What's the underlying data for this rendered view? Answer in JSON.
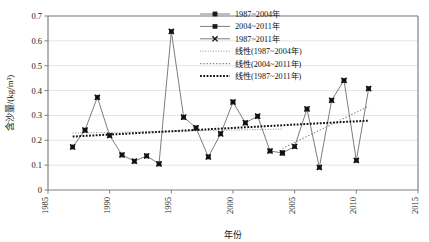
{
  "chart_data": {
    "type": "line",
    "title": "",
    "xlabel": "年份",
    "ylabel": "含沙量/(kg/m³)",
    "xlim": [
      1985,
      2015
    ],
    "ylim": [
      0,
      0.7
    ],
    "xticks": [
      "1985",
      "1990",
      "1995",
      "2000",
      "2005",
      "2010",
      "2015"
    ],
    "yticks": [
      "0",
      "0.1",
      "0.2",
      "0.3",
      "0.4",
      "0.5",
      "0.6",
      "0.7"
    ],
    "grid": true,
    "legend_position": "top-center",
    "x": [
      1987,
      1988,
      1989,
      1990,
      1991,
      1992,
      1993,
      1994,
      1995,
      1996,
      1997,
      1998,
      1999,
      2000,
      2001,
      2002,
      2003,
      2004,
      2005,
      2006,
      2007,
      2008,
      2009,
      2010,
      2011
    ],
    "series": [
      {
        "name": "1987~2004年",
        "marker": "square",
        "color": "#4a4a4a",
        "x": [
          1987,
          1988,
          1989,
          1990,
          1991,
          1992,
          1993,
          1994,
          1995,
          1996,
          1997,
          1998,
          1999,
          2000,
          2001,
          2002,
          2003,
          2004
        ],
        "values": [
          0.173,
          0.241,
          0.373,
          0.219,
          0.141,
          0.116,
          0.137,
          0.105,
          0.638,
          0.293,
          0.25,
          0.133,
          0.226,
          0.354,
          0.27,
          0.297,
          0.157,
          0.149
        ]
      },
      {
        "name": "2004~2011年",
        "marker": "square",
        "color": "#4a4a4a",
        "x": [
          2004,
          2005,
          2006,
          2007,
          2008,
          2009,
          2010,
          2011
        ],
        "values": [
          0.149,
          0.175,
          0.326,
          0.091,
          0.361,
          0.441,
          0.119,
          0.408
        ]
      },
      {
        "name": "1987~2011年",
        "marker": "cross",
        "color": "#111111",
        "x": [
          1987,
          1988,
          1989,
          1990,
          1991,
          1992,
          1993,
          1994,
          1995,
          1996,
          1997,
          1998,
          1999,
          2000,
          2001,
          2002,
          2003,
          2004,
          2005,
          2006,
          2007,
          2008,
          2009,
          2010,
          2011
        ],
        "values": [
          0.173,
          0.241,
          0.373,
          0.219,
          0.141,
          0.116,
          0.137,
          0.105,
          0.638,
          0.293,
          0.25,
          0.133,
          0.226,
          0.354,
          0.27,
          0.297,
          0.157,
          0.149,
          0.175,
          0.326,
          0.091,
          0.361,
          0.441,
          0.119,
          0.408
        ]
      }
    ],
    "trendlines": [
      {
        "name": "线性(1987~2004年)",
        "style": "dotted-fine",
        "color": "#7d7d7d",
        "x_start": 1987,
        "x_end": 2004,
        "y_start": 0.229,
        "y_end": 0.245
      },
      {
        "name": "线性(2004~2011年)",
        "style": "dotted-medium",
        "color": "#8a8a8a",
        "x_start": 2004,
        "x_end": 2011,
        "y_start": 0.167,
        "y_end": 0.337
      },
      {
        "name": "线性(1987~2011年)",
        "style": "dotted-bold",
        "color": "#111111",
        "x_start": 1987,
        "x_end": 2011,
        "y_start": 0.215,
        "y_end": 0.279
      }
    ]
  },
  "legend": {
    "items": [
      {
        "label": "1987~2004年",
        "kind": "marker-line",
        "marker": "square"
      },
      {
        "label": "2004~2011年",
        "kind": "marker-line",
        "marker": "square"
      },
      {
        "label": "1987~2011年",
        "kind": "marker-line",
        "marker": "cross"
      },
      {
        "label": "线性(1987~2004年)",
        "kind": "dotted-fine",
        "marker": "none"
      },
      {
        "label": "线性(2004~2011年)",
        "kind": "dotted-medium",
        "marker": "none"
      },
      {
        "label": "线性(1987~2011年)",
        "kind": "dotted-bold",
        "marker": "none"
      }
    ]
  },
  "colors": {
    "axis": "#808080",
    "grid": "#d9d9d9",
    "series_line": "#6e6e6e",
    "marker_fill": "#1a1a1a",
    "trend_dark": "#111111",
    "background": "#ffffff"
  }
}
